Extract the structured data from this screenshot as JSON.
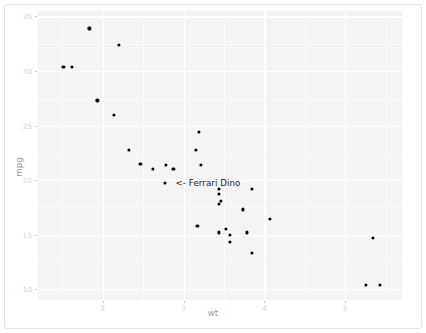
{
  "chart_data": {
    "type": "scatter",
    "title": "",
    "xlabel": "wt",
    "ylabel": "mpg",
    "xlim": [
      1.2,
      5.7
    ],
    "ylim": [
      9.0,
      35.5
    ],
    "grid": true,
    "legend": null,
    "x_ticks": [
      2,
      3,
      4,
      5
    ],
    "x_tick_labels": [
      "2",
      "3",
      "4",
      "5"
    ],
    "y_ticks": [
      10,
      15,
      20,
      25,
      30,
      35
    ],
    "y_tick_labels": [
      "10",
      "15",
      "20",
      "25",
      "30",
      "35"
    ],
    "x_minor_ticks": [
      1.5,
      2.5,
      3.5,
      4.5,
      5.5
    ],
    "y_minor_ticks": [
      12.5,
      17.5,
      22.5,
      27.5,
      32.5
    ],
    "point_color": "#000000",
    "panel_background": "#f4f4f4",
    "gridline_color": "#ffffff",
    "points": [
      {
        "label": "Mazda RX4",
        "x": 2.62,
        "y": 21.0
      },
      {
        "label": "Mazda RX4 Wag",
        "x": 2.875,
        "y": 21.0
      },
      {
        "label": "Datsun 710",
        "x": 2.32,
        "y": 22.8
      },
      {
        "label": "Hornet 4 Drive",
        "x": 3.215,
        "y": 21.4
      },
      {
        "label": "Hornet Sportabout",
        "x": 3.44,
        "y": 18.7
      },
      {
        "label": "Valiant",
        "x": 3.46,
        "y": 18.1
      },
      {
        "label": "Duster 360",
        "x": 3.57,
        "y": 14.3
      },
      {
        "label": "Merc 240D",
        "x": 3.19,
        "y": 24.4
      },
      {
        "label": "Merc 230",
        "x": 3.15,
        "y": 22.8
      },
      {
        "label": "Merc 280",
        "x": 3.44,
        "y": 19.2
      },
      {
        "label": "Merc 280C",
        "x": 3.44,
        "y": 17.8
      },
      {
        "label": "Merc 450SE",
        "x": 4.07,
        "y": 16.4
      },
      {
        "label": "Merc 450SL",
        "x": 3.73,
        "y": 17.3
      },
      {
        "label": "Merc 450SLC",
        "x": 3.78,
        "y": 15.2
      },
      {
        "label": "Cadillac Fleetwood",
        "x": 5.25,
        "y": 10.4
      },
      {
        "label": "Lincoln Continental",
        "x": 5.424,
        "y": 10.4
      },
      {
        "label": "Chrysler Imperial",
        "x": 5.345,
        "y": 14.7
      },
      {
        "label": "Fiat 128",
        "x": 2.2,
        "y": 32.4
      },
      {
        "label": "Honda Civic",
        "x": 1.615,
        "y": 30.4
      },
      {
        "label": "Toyota Corolla",
        "x": 1.835,
        "y": 33.9
      },
      {
        "label": "Toyota Corona",
        "x": 2.465,
        "y": 21.5
      },
      {
        "label": "Dodge Challenger",
        "x": 3.52,
        "y": 15.5
      },
      {
        "label": "AMC Javelin",
        "x": 3.435,
        "y": 15.2
      },
      {
        "label": "Camaro Z28",
        "x": 3.84,
        "y": 13.3
      },
      {
        "label": "Pontiac Firebird",
        "x": 3.845,
        "y": 19.2
      },
      {
        "label": "Fiat X1-9",
        "x": 1.935,
        "y": 27.3
      },
      {
        "label": "Porsche 914-2",
        "x": 2.14,
        "y": 26.0
      },
      {
        "label": "Lotus Europa",
        "x": 1.513,
        "y": 30.4
      },
      {
        "label": "Ford Pantera L",
        "x": 3.17,
        "y": 15.8
      },
      {
        "label": "Ferrari Dino",
        "x": 2.77,
        "y": 19.7
      },
      {
        "label": "Maserati Bora",
        "x": 3.57,
        "y": 15.0
      },
      {
        "label": "Volvo 142E",
        "x": 2.78,
        "y": 21.4
      }
    ],
    "annotations": [
      {
        "text": "<- Ferrari Dino",
        "x": 2.9,
        "y": 19.7,
        "color": "#1a1a1a"
      }
    ]
  }
}
